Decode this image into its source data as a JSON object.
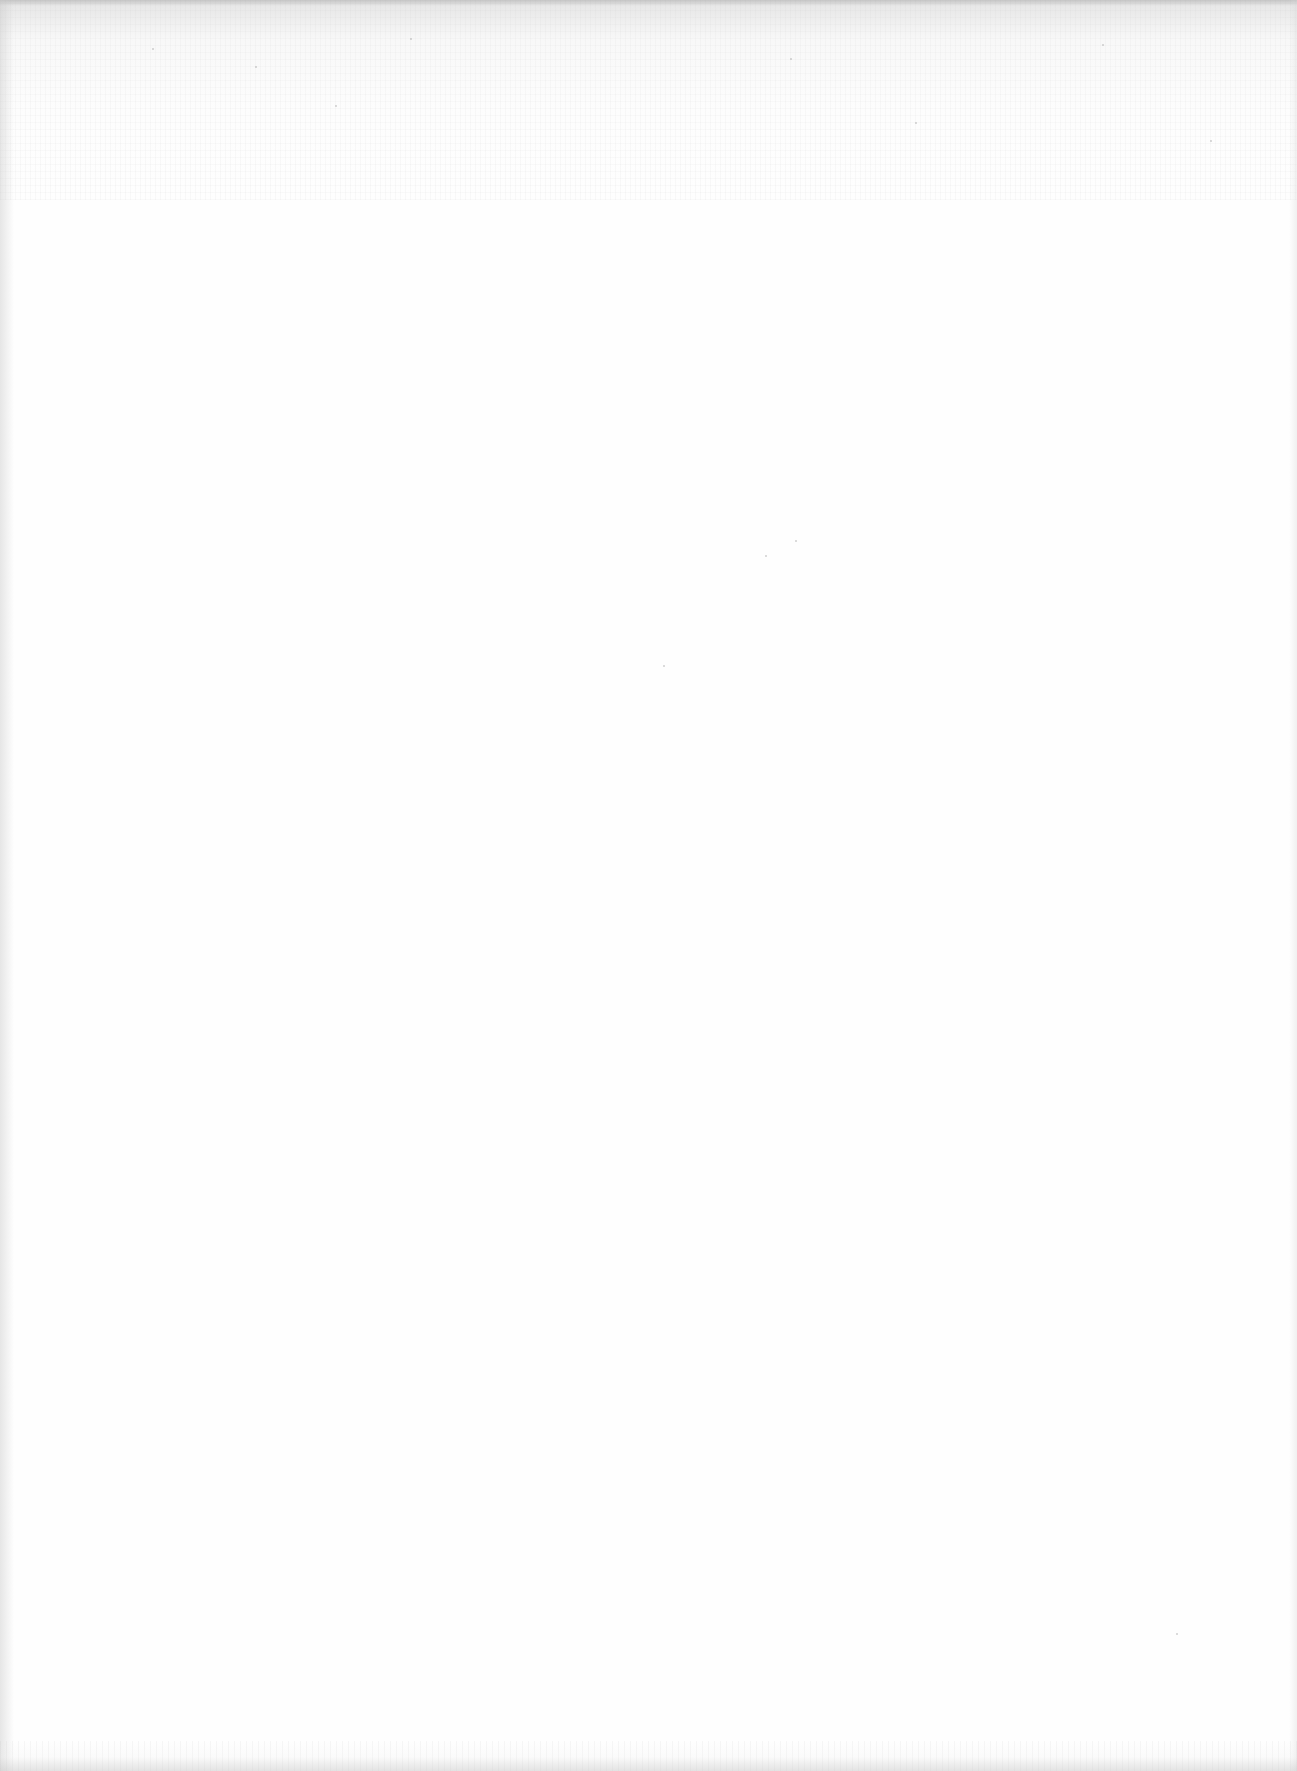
{
  "page": {
    "type": "blank scanned page",
    "background_color": "#fefefe",
    "noise_color": "#969696",
    "text_content": []
  }
}
